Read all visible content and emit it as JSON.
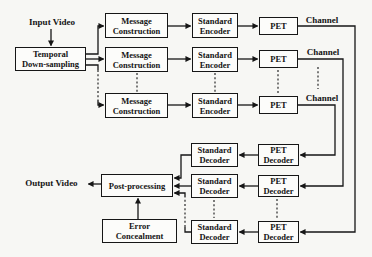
{
  "canvas": {
    "background": "#f7f7f4",
    "ink": "#161616",
    "box_fill": "#fcfcfa"
  },
  "labels": {
    "input_video": "Input Video",
    "output_video": "Output Video",
    "channel": "Channel"
  },
  "nodes": {
    "temporal_downsampling": {
      "line1": "Temporal",
      "line2": "Down-sampling"
    },
    "message_construction": {
      "line1": "Message",
      "line2": "Construction"
    },
    "standard_encoder": {
      "line1": "Standard",
      "line2": "Encoder"
    },
    "pet": {
      "label": "PET"
    },
    "pet_decoder": {
      "line1": "PET",
      "line2": "Decoder"
    },
    "standard_decoder": {
      "line1": "Standard",
      "line2": "Decoder"
    },
    "post_processing": {
      "label": "Post-processing"
    },
    "error_concealment": {
      "line1": "Error",
      "line2": "Concealment"
    }
  }
}
